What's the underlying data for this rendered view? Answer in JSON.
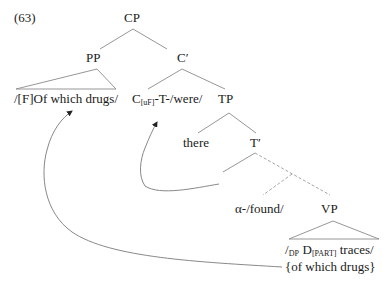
{
  "example_number": "(63)",
  "nodes": {
    "cp": "CP",
    "pp": "PP",
    "c_bar": "C′",
    "pp_content": "/[F]Of which drugs/",
    "c_head_main": "C",
    "c_head_sub": "[uF]",
    "c_head_rest": "-T-/were/",
    "tp": "TP",
    "there": "there",
    "t_bar": "T′",
    "alpha_found": "α-/found/",
    "vp": "VP",
    "vp_line1_pre": "/",
    "vp_line1_dp": "DP",
    "vp_line1_d": " D",
    "vp_line1_part": "[PART]",
    "vp_line1_post": " traces/",
    "vp_line2": "{of which drugs}"
  },
  "edges": {
    "solid_color": "#8a8a8a",
    "dashed_color": "#9a9a9a",
    "arrow_color": "#222222"
  }
}
